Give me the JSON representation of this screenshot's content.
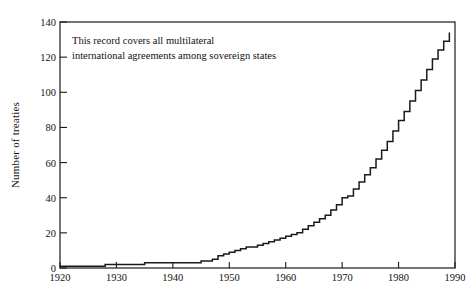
{
  "chart_data": {
    "type": "line",
    "title": "",
    "subtitle": "",
    "xlabel": "",
    "ylabel": "Number of treaties",
    "xlim": [
      1920,
      1990
    ],
    "ylim": [
      0,
      140
    ],
    "grid": false,
    "legend": "none",
    "step_style": "post",
    "annotations": [
      {
        "text": "This record covers all multilateral\ninternational agreements among sovereign states",
        "x": 1923,
        "y": 124
      }
    ],
    "xticks": [
      1920,
      1930,
      1940,
      1950,
      1960,
      1970,
      1980,
      1990
    ],
    "yticks": [
      0,
      20,
      40,
      60,
      80,
      100,
      120,
      140
    ],
    "series": [
      {
        "name": "Cumulative multilateral treaties",
        "color": "#1a1a1a",
        "x": [
          1920,
          1921,
          1922,
          1923,
          1924,
          1925,
          1926,
          1927,
          1928,
          1929,
          1930,
          1931,
          1932,
          1933,
          1934,
          1935,
          1936,
          1937,
          1938,
          1939,
          1940,
          1941,
          1942,
          1943,
          1944,
          1945,
          1946,
          1947,
          1948,
          1949,
          1950,
          1951,
          1952,
          1953,
          1954,
          1955,
          1956,
          1957,
          1958,
          1959,
          1960,
          1961,
          1962,
          1963,
          1964,
          1965,
          1966,
          1967,
          1968,
          1969,
          1970,
          1971,
          1972,
          1973,
          1974,
          1975,
          1976,
          1977,
          1978,
          1979,
          1980,
          1981,
          1982,
          1983,
          1984,
          1985,
          1986,
          1987,
          1988,
          1989
        ],
        "values": [
          1,
          1,
          1,
          1,
          1,
          1,
          1,
          1,
          2,
          2,
          2,
          2,
          2,
          2,
          2,
          3,
          3,
          3,
          3,
          3,
          3,
          3,
          3,
          3,
          3,
          4,
          4,
          5,
          7,
          8,
          9,
          10,
          11,
          12,
          12,
          13,
          14,
          15,
          16,
          17,
          18,
          19,
          20,
          22,
          24,
          26,
          28,
          30,
          33,
          36,
          40,
          41,
          45,
          49,
          53,
          57,
          62,
          67,
          72,
          78,
          84,
          89,
          95,
          101,
          107,
          113,
          119,
          124,
          129,
          134
        ]
      }
    ]
  },
  "axes": {
    "y_title": "Number of treaties"
  }
}
